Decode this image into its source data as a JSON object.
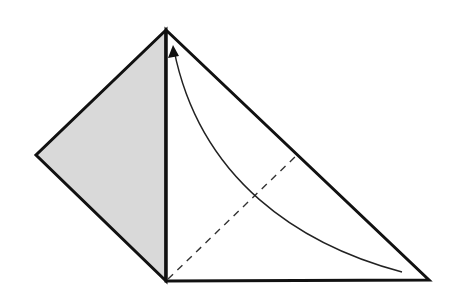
{
  "diagram": {
    "type": "origami-fold-step",
    "background": "#ffffff",
    "colors": {
      "outline": "#111111",
      "shaded_flap": "#d9d9d9",
      "paper": "#ffffff",
      "dashed_crease": "#333333",
      "arrow": "#222222"
    },
    "vertices": {
      "top": [
        166,
        30
      ],
      "left": [
        36,
        155
      ],
      "bottom": [
        166,
        281
      ],
      "right": [
        429,
        280
      ]
    },
    "shaded_flap": {
      "points": "166,30 36,155 166,281"
    },
    "white_triangle": {
      "points": "166,30 429,280 166,281"
    },
    "center_fold_line": {
      "x1": 166,
      "y1": 30,
      "x2": 166,
      "y2": 281
    },
    "valley_fold_line": {
      "x1": 168,
      "y1": 279,
      "x2": 297,
      "y2": 155,
      "dash": "7,6"
    },
    "fold_arrow": {
      "path": "M 402 272 C 300 245, 200 180, 174 50",
      "arrowhead_points": "173,45 168,58 179,56",
      "meaning": "fold-right-corner-up-to-top"
    }
  }
}
